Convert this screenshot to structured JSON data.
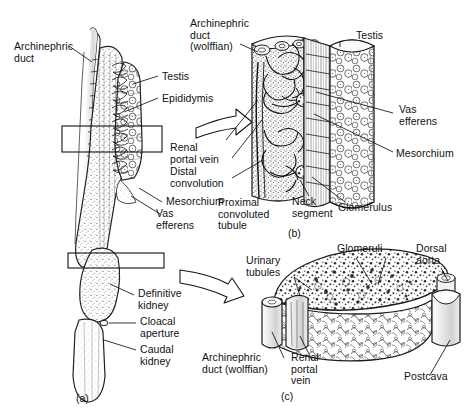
{
  "figure": {
    "style": "pen-and-ink anatomical line drawing, grayscale",
    "background_color": "#ffffff",
    "ink_color": "#111111",
    "panels": [
      {
        "id": "a",
        "caption": "(a)",
        "description": "Whole ventral view of opisthonephric kidney with testis and archinephric duct"
      },
      {
        "id": "b",
        "caption": "(b)",
        "description": "Enlarged longitudinal detail of anterior kidney, epididymis and testis"
      },
      {
        "id": "c",
        "caption": "(c)",
        "description": "Enlarged transverse block of the definitive (posterior) kidney with dorsal aorta and postcava"
      }
    ],
    "labels": {
      "panel_a": [
        {
          "key": "archinephric_duct",
          "text": "Archinephric\nduct"
        },
        {
          "key": "testis",
          "text": "Testis"
        },
        {
          "key": "epididymis",
          "text": "Epididymis"
        },
        {
          "key": "mesorchium",
          "text": "Mesorchium"
        },
        {
          "key": "vas_efferens",
          "text": "Vas\nefferens"
        },
        {
          "key": "definitive_kidney",
          "text": "Definitive\nkidney"
        },
        {
          "key": "cloacal_aperture",
          "text": "Cloacal\naperture"
        },
        {
          "key": "caudal_kidney",
          "text": "Caudal\nkidney"
        }
      ],
      "panel_b": [
        {
          "key": "archinephric_duct_wolffian",
          "text": "Archinephric\nduct\n(wolffian)"
        },
        {
          "key": "testis",
          "text": "Testis"
        },
        {
          "key": "vas_efferens",
          "text": "Vas\nefferens"
        },
        {
          "key": "mesorchium",
          "text": "Mesorchium"
        },
        {
          "key": "glomerulus",
          "text": "Glomerulus"
        },
        {
          "key": "neck_segment",
          "text": "Neck\nsegment"
        },
        {
          "key": "proximal_convoluted_tubule",
          "text": "Proximal\nconvoluted\ntubule"
        },
        {
          "key": "distal_convolution",
          "text": "Distal\nconvolution"
        },
        {
          "key": "renal_portal_vein",
          "text": "Renal\nportal vein"
        }
      ],
      "panel_c": [
        {
          "key": "urinary_tubules",
          "text": "Urinary\ntubules"
        },
        {
          "key": "glomeruli",
          "text": "Glomeruli"
        },
        {
          "key": "dorsal_aorta",
          "text": "Dorsal\naorta"
        },
        {
          "key": "postcava",
          "text": "Postcava"
        },
        {
          "key": "archinephric_duct_wolffian",
          "text": "Archinephric\nduct (wolffian)"
        },
        {
          "key": "renal_portal_vein",
          "text": "Renal\nportal\nvein"
        }
      ]
    }
  },
  "text": {
    "archinephric_duct_l1": "Archinephric",
    "archinephric_duct_l2": "duct",
    "testis_a": "Testis",
    "epididymis": "Epididymis",
    "mesorchium_a": "Mesorchium",
    "vas_efferens_a_l1": "Vas",
    "vas_efferens_a_l2": "efferens",
    "definitive_kidney_l1": "Definitive",
    "definitive_kidney_l2": "kidney",
    "cloacal_aperture_l1": "Cloacal",
    "cloacal_aperture_l2": "aperture",
    "caudal_kidney_l1": "Caudal",
    "caudal_kidney_l2": "kidney",
    "panel_a_id": "(a)",
    "arch_duct_wolffian_b_l1": "Archinephric",
    "arch_duct_wolffian_b_l2": "duct",
    "arch_duct_wolffian_b_l3": "(wolffian)",
    "testis_b": "Testis",
    "vas_efferens_b_l1": "Vas",
    "vas_efferens_b_l2": "efferens",
    "mesorchium_b": "Mesorchium",
    "glomerulus_b": "Glomerulus",
    "neck_segment_l1": "Neck",
    "neck_segment_l2": "segment",
    "proximal_tubule_l1": "Proximal",
    "proximal_tubule_l2": "convoluted",
    "proximal_tubule_l3": "tubule",
    "distal_convolution_l1": "Distal",
    "distal_convolution_l2": "convolution",
    "renal_portal_vein_b_l1": "Renal",
    "renal_portal_vein_b_l2": "portal vein",
    "panel_b_id": "(b)",
    "urinary_tubules_l1": "Urinary",
    "urinary_tubules_l2": "tubules",
    "glomeruli_c": "Glomeruli",
    "dorsal_aorta_l1": "Dorsal",
    "dorsal_aorta_l2": "aorta",
    "postcava_c": "Postcava",
    "arch_duct_wolffian_c_l1": "Archinephric",
    "arch_duct_wolffian_c_l2": "duct (wolffian)",
    "renal_portal_vein_c_l1": "Renal",
    "renal_portal_vein_c_l2": "portal",
    "renal_portal_vein_c_l3": "vein",
    "panel_c_id": "(c)"
  }
}
